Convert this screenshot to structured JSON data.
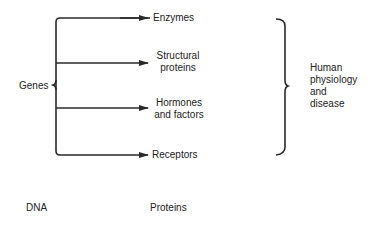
{
  "diagram": {
    "source": {
      "label": "Genes"
    },
    "targets": [
      {
        "label_lines": [
          "Enzymes"
        ]
      },
      {
        "label_lines": [
          "Structural",
          "proteins"
        ]
      },
      {
        "label_lines": [
          "Hormones",
          "and factors"
        ]
      },
      {
        "label_lines": [
          "Receptors"
        ]
      }
    ],
    "outcome": {
      "label_lines": [
        "Human",
        "physiology",
        "and",
        "disease"
      ]
    },
    "footer": {
      "left": "DNA",
      "middle": "Proteins"
    },
    "colors": {
      "line": "#2a2a2a",
      "text": "#222222"
    }
  }
}
